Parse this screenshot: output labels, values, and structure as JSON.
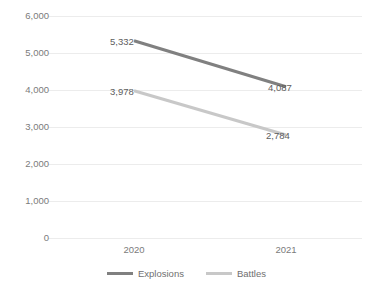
{
  "chart_data": {
    "type": "line",
    "title": "",
    "subtitle": "",
    "xlabel": "",
    "ylabel": "",
    "categories": [
      "2020",
      "2021"
    ],
    "series": [
      {
        "name": "Explosions",
        "color": "#808080",
        "values": [
          5332,
          2784
        ],
        "labels": [
          "5,332",
          "4,087"
        ]
      },
      {
        "name": "Battles",
        "color": "#c8c8c8",
        "values": [
          3978,
          2784
        ],
        "labels": [
          "3,978",
          "2,784"
        ]
      }
    ],
    "ylim": [
      0,
      6000
    ],
    "ytick_values": [
      6000,
      5000,
      4000,
      3000,
      2000,
      1000,
      0
    ],
    "ytick_labels": [
      "6,000",
      "5,000",
      "4,000",
      "3,000",
      "2,000",
      "1,000",
      "0"
    ],
    "grid": true,
    "grid_color": "#ececec",
    "legend_position": "bottom"
  },
  "axes": {
    "y": {
      "ticks": [
        {
          "label": "6,000",
          "value": 6000
        },
        {
          "label": "5,000",
          "value": 5000
        },
        {
          "label": "4,000",
          "value": 4000
        },
        {
          "label": "3,000",
          "value": 3000
        },
        {
          "label": "2,000",
          "value": 2000
        },
        {
          "label": "1,000",
          "value": 1000
        },
        {
          "label": "0",
          "value": 0
        }
      ]
    },
    "x": {
      "ticks": [
        {
          "label": "2020"
        },
        {
          "label": "2021"
        }
      ]
    }
  },
  "data_labels": [
    {
      "text": "5,332",
      "series": "Explosions",
      "category": "2020"
    },
    {
      "text": "4,087",
      "series": "Explosions",
      "category": "2021"
    },
    {
      "text": "3,978",
      "series": "Battles",
      "category": "2020"
    },
    {
      "text": "2,784",
      "series": "Battles",
      "category": "2021"
    }
  ],
  "legend": {
    "items": [
      {
        "label": "Explosions",
        "color": "#808080"
      },
      {
        "label": "Battles",
        "color": "#c8c8c8"
      }
    ]
  }
}
